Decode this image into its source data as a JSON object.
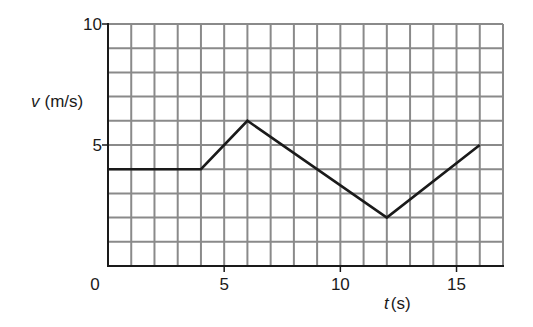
{
  "chart_data": {
    "type": "line",
    "title": "",
    "xlabel": "t (s)",
    "xlabel_var": "t",
    "xlabel_unit": "(s)",
    "ylabel": "v (m/s)",
    "ylabel_var": "v",
    "ylabel_unit": "(m/s)",
    "xlim": [
      0,
      17
    ],
    "ylim": [
      0,
      10
    ],
    "x_ticks": [
      0,
      5,
      10,
      15
    ],
    "y_ticks": [
      0,
      5,
      10
    ],
    "x_tick_labels": [
      "0",
      "5",
      "10",
      "15"
    ],
    "y_tick_labels": [
      "5",
      "10"
    ],
    "grid": true,
    "grid_step_x": 1,
    "grid_step_y": 1,
    "legend": null,
    "series": [
      {
        "name": "velocity",
        "x": [
          0,
          4,
          6,
          12,
          16
        ],
        "y": [
          4,
          4,
          6,
          2,
          5
        ]
      }
    ]
  },
  "colors": {
    "grid": "#8a8a8a",
    "axis": "#1a1a1a",
    "line": "#1a1a1a",
    "background": "#ffffff"
  }
}
